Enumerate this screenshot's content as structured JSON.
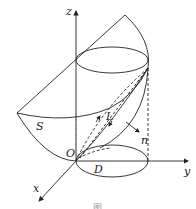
{
  "figure": {
    "labels": {
      "z_axis": "z",
      "y_axis": "y",
      "x_axis": "x",
      "origin": "O",
      "surface": "S",
      "curve": "L",
      "normal": "n",
      "region": "D"
    },
    "caption": "图",
    "colors": {
      "stroke": "#222222",
      "background": "#ffffff"
    }
  }
}
